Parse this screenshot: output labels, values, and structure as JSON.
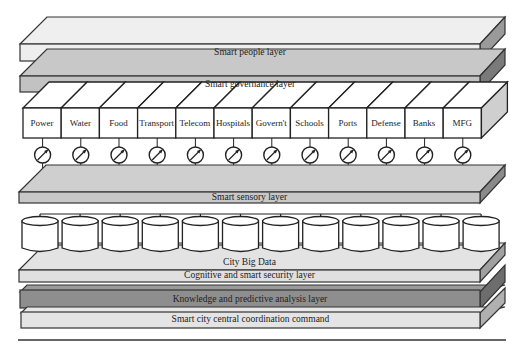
{
  "diagram": {
    "type": "layered-architecture",
    "layers": [
      {
        "id": "people",
        "label": "Smart people layer",
        "color": "#ececec"
      },
      {
        "id": "governance",
        "label": "Smart governance layer",
        "color": "#c4c4c4"
      },
      {
        "id": "sensory",
        "label": "Smart sensory layer",
        "color": "#cdcdcd"
      },
      {
        "id": "bigdata",
        "label": "City Big Data",
        "color": "#e2e2e2"
      },
      {
        "id": "cognitive",
        "label": "Cognitive and smart security layer",
        "color": "#dedede"
      },
      {
        "id": "knowledge",
        "label": "Knowledge and predictive analysis layer",
        "color": "#8e8e8e"
      },
      {
        "id": "command",
        "label": "Smart city central coordination command",
        "color": "#e4e4e4"
      }
    ],
    "sectors": [
      "Power",
      "Water",
      "Food",
      "Transport",
      "Telecom",
      "Hospitals",
      "Govern't",
      "Schools",
      "Ports",
      "Defense",
      "Banks",
      "MFG"
    ],
    "sensor_icon": "gauge-icon",
    "storage_icon": "database-cylinder-icon",
    "storage_count": 12
  }
}
